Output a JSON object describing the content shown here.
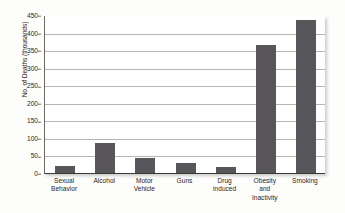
{
  "chart_data": {
    "type": "bar",
    "title": "",
    "subtitle": "",
    "xlabel": "",
    "ylabel": "No. of Deaths (thousands)",
    "ylim": [
      0,
      450
    ],
    "yticks": [
      0,
      50,
      100,
      150,
      200,
      250,
      300,
      350,
      400,
      450
    ],
    "grid": true,
    "legend": false,
    "legend_position": "none",
    "bar_color": "#58565a",
    "categories": [
      "Sexual Behavior",
      "Alcohol",
      "Motor Vehicle",
      "Guns",
      "Drug induced",
      "Obesity and Inactivity",
      "Smoking"
    ],
    "category_lines": [
      [
        "Sexual",
        "Behavior"
      ],
      [
        "Alcohol"
      ],
      [
        "Motor",
        "Vehicle"
      ],
      [
        "Guns"
      ],
      [
        "Drug",
        "induced"
      ],
      [
        "Obesity",
        "and",
        "Inactivity"
      ],
      [
        "Smoking"
      ]
    ],
    "values": [
      20,
      85,
      43,
      29,
      17,
      365,
      435
    ]
  }
}
